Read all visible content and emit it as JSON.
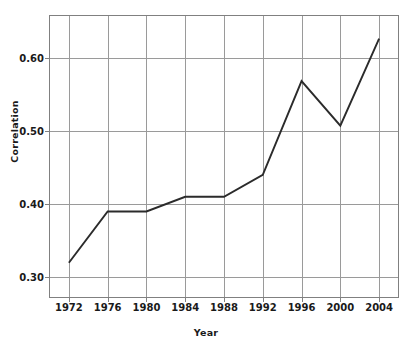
{
  "chart_data": {
    "type": "line",
    "title": "",
    "xlabel": "Year",
    "ylabel": "Correlation",
    "x": [
      1972,
      1976,
      1980,
      1984,
      1988,
      1992,
      1996,
      2000,
      2004
    ],
    "categories": [
      "1972",
      "1976",
      "1980",
      "1984",
      "1988",
      "1992",
      "1996",
      "2000",
      "2004"
    ],
    "values": [
      0.32,
      0.39,
      0.39,
      0.41,
      0.41,
      0.44,
      0.568,
      0.507,
      0.626
    ],
    "series": [
      {
        "name": "Correlation",
        "values": [
          0.32,
          0.39,
          0.39,
          0.41,
          0.41,
          0.44,
          0.568,
          0.507,
          0.626
        ]
      }
    ],
    "xlim": [
      1970,
      2006
    ],
    "ylim": [
      0.2725,
      0.6575
    ],
    "ytick_labels": [
      "0.30",
      "0.40",
      "0.50",
      "0.60"
    ],
    "ytick_values": [
      0.3,
      0.4,
      0.5,
      0.6
    ],
    "xtick_labels": [
      "1972",
      "1976",
      "1980",
      "1984",
      "1988",
      "1992",
      "1996",
      "2000",
      "2004"
    ],
    "grid": "both",
    "legend": "none",
    "line_color": "#2b2b2b",
    "grid_color": "#9a9a9a",
    "axis_color": "#808080",
    "text_color": "#1a1a1a",
    "background": "#ffffff",
    "markers": "none"
  }
}
